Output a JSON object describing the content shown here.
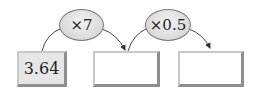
{
  "operators": [
    {
      "label": "×7"
    },
    {
      "label": "×0.5"
    }
  ],
  "boxes": [
    {
      "value": "3.64",
      "filled": true
    },
    {
      "value": "",
      "filled": false
    },
    {
      "value": "",
      "filled": false
    }
  ]
}
